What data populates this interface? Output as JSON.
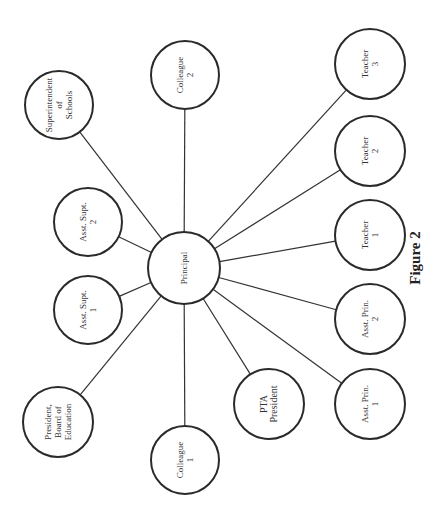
{
  "caption": "Figure 2",
  "center": {
    "id": "principal",
    "label": [
      "Principal"
    ],
    "x": 184,
    "y": 268,
    "r": 36
  },
  "nodes": [
    {
      "id": "superintendent",
      "label": [
        "Superintendent",
        "of",
        "Schools"
      ],
      "x": 59,
      "y": 105,
      "r": 34
    },
    {
      "id": "colleague-2",
      "label": [
        "Colleague",
        "2"
      ],
      "x": 185,
      "y": 75,
      "r": 34
    },
    {
      "id": "teacher-3",
      "label": [
        "Teacher",
        "3"
      ],
      "x": 370,
      "y": 64,
      "r": 35
    },
    {
      "id": "asst-supt-2",
      "label": [
        "Asst. Supt.",
        "2"
      ],
      "x": 88,
      "y": 222,
      "r": 34
    },
    {
      "id": "teacher-2",
      "label": [
        "Teacher",
        "2"
      ],
      "x": 370,
      "y": 151,
      "r": 35
    },
    {
      "id": "teacher-1",
      "label": [
        "Teacher",
        "1"
      ],
      "x": 370,
      "y": 235,
      "r": 35
    },
    {
      "id": "asst-supt-1",
      "label": [
        "Asst. Supt.",
        "1"
      ],
      "x": 88,
      "y": 310,
      "r": 34
    },
    {
      "id": "asst-prin-2",
      "label": [
        "Asst. Prin.",
        "2"
      ],
      "x": 370,
      "y": 319,
      "r": 35
    },
    {
      "id": "president-board",
      "label": [
        "President,",
        "Board of",
        "Education"
      ],
      "x": 58,
      "y": 422,
      "r": 35
    },
    {
      "id": "pta-president",
      "label": [
        "PTA",
        "President"
      ],
      "x": 269,
      "y": 404,
      "r": 35,
      "bold": true
    },
    {
      "id": "asst-prin-1",
      "label": [
        "Asst. Prin.",
        "1"
      ],
      "x": 370,
      "y": 404,
      "r": 35
    },
    {
      "id": "colleague-1",
      "label": [
        "Colleague",
        "1"
      ],
      "x": 185,
      "y": 460,
      "r": 34
    }
  ],
  "caption_pos": {
    "x": 420,
    "y": 258
  },
  "colors": {
    "stroke": "#2a2a2a",
    "text": "#333333",
    "background": "#ffffff"
  }
}
